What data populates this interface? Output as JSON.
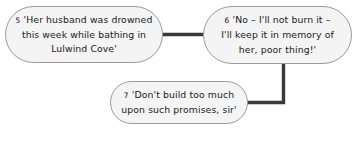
{
  "diagram": {
    "type": "flow-diagram",
    "background_color": "#ffffff",
    "node_fill_color": "#f4f4f4",
    "node_border_color": "#9a9a9a",
    "connector_color": "#3a3a3a",
    "text_color": "#1a1a1a",
    "nodes": [
      {
        "id": "node-5",
        "number": "5",
        "text": "'Her husband was drowned\nthis week while bathing in\nLulwind Cove'",
        "line1": "'Her husband was drowned",
        "line2": "this week while bathing in",
        "line3": "Lulwind Cove'"
      },
      {
        "id": "node-6",
        "number": "6",
        "text": "'No – I'll not burn it –\nI'll keep it in memory of\nher, poor thing!'",
        "line1": "'No – I'll not burn it –",
        "line2": "I'll keep it in memory of",
        "line3": "her, poor thing!'"
      },
      {
        "id": "node-7",
        "number": "7",
        "text": "'Don't build too much\nupon such promises, sir'",
        "line1": "'Don't build too much",
        "line2": "upon such promises, sir'"
      }
    ],
    "connectors": [
      {
        "id": "connector-5-to-6",
        "from": "node-5",
        "to": "node-6",
        "style": "horizontal"
      },
      {
        "id": "connector-6-to-7",
        "from": "node-6",
        "to": "node-7",
        "style": "elbow-down-left"
      }
    ]
  }
}
